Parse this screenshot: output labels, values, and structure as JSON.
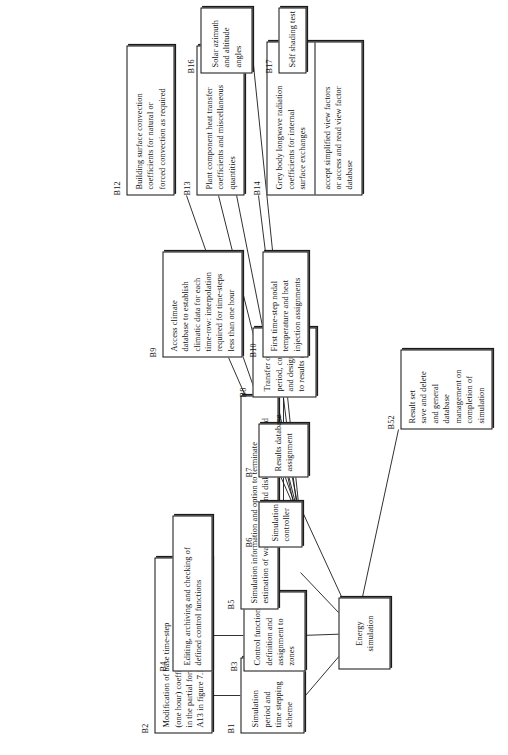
{
  "diagram": {
    "type": "hierarchical-tree",
    "orientation": "rotated-90-ccw",
    "colors": {
      "line": "#111111",
      "box_fill": "#ffffff",
      "page": "#ffffff"
    },
    "root": {
      "tag": "",
      "lines": [
        "Energy",
        "simulation"
      ]
    },
    "nodes": [
      {
        "id": "B1",
        "tag": "B1",
        "lines": [
          "Simulation",
          "period and",
          "time stepping",
          "scheme"
        ]
      },
      {
        "id": "B2",
        "tag": "B2",
        "lines": [
          "Modification of base time-step",
          "(one hour) coefficients established",
          "in the partial formulations of step",
          "A13 in figure 7.13"
        ]
      },
      {
        "id": "B3",
        "tag": "B3",
        "lines": [
          "Control function",
          "definition and",
          "assignment to",
          "zones"
        ]
      },
      {
        "id": "B4",
        "tag": "B4",
        "lines": [
          "Editing, archiving and checking of",
          "defined control functions"
        ]
      },
      {
        "id": "B5",
        "tag": "B5",
        "lines": [
          "Simulation information and option to terminate",
          "estimation of wait time, cost and disk storage required"
        ]
      },
      {
        "id": "B6",
        "tag": "B6",
        "lines": [
          "Simulation",
          "controller"
        ]
      },
      {
        "id": "B7",
        "tag": "B7",
        "lines": [
          "Results database",
          "assignment"
        ]
      },
      {
        "id": "B8",
        "tag": "B8",
        "lines": [
          "Transfer of simulation",
          "period, control function",
          "and design description",
          "to results database"
        ]
      },
      {
        "id": "B9",
        "tag": "B9",
        "lines": [
          "Access climate",
          "database to establish",
          "climatic data for each",
          "time-row: interpolation",
          "required for time-steps",
          "less than one hour"
        ]
      },
      {
        "id": "B10",
        "tag": "B10",
        "lines": [
          "First time-step nodal",
          "temperature and heat",
          "injection assignments"
        ]
      },
      {
        "id": "B12",
        "tag": "B12",
        "lines": [
          "Building surface convection",
          "coefficients for natural or",
          "forced convection as required"
        ]
      },
      {
        "id": "B13",
        "tag": "B13",
        "lines": [
          "Plant component heat transfer",
          "coefficients and miscellaneous",
          "quantities"
        ]
      },
      {
        "id": "B14",
        "tag": "B14",
        "cells": [
          {
            "lines": [
              "Grey body longwave radiation",
              "coefficients for internal",
              "surface exchanges"
            ]
          },
          {
            "lines": [
              "accept simplified view factors",
              "or access and read view factor",
              "database"
            ]
          }
        ]
      },
      {
        "id": "B16",
        "tag": "B16",
        "lines": [
          "Solar azimuth",
          "and altitude",
          "angles"
        ]
      },
      {
        "id": "B17",
        "tag": "B17",
        "lines": [
          "Self shading test"
        ]
      },
      {
        "id": "B52",
        "tag": "B52",
        "lines": [
          "Result set",
          "save and delete",
          "and general",
          "database",
          "management on",
          "completion of",
          "simulation"
        ]
      }
    ]
  }
}
